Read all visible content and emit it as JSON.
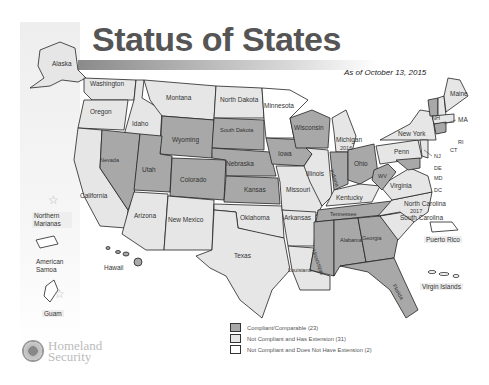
{
  "title": "Status of States",
  "as_of": "As of October 13, 2015",
  "colors": {
    "compliant": "#a8a8a8",
    "extension": "#e6e6e6",
    "no_extension": "#ffffff",
    "border": "#222222"
  },
  "legend": [
    {
      "label": "Compliant/Comparable (23)",
      "status": "compliant"
    },
    {
      "label": "Not Compliant and Has Extension (31)",
      "status": "extension"
    },
    {
      "label": "Not Compliant and Does Not Have Extension (2)",
      "status": "no_extension"
    }
  ],
  "states": {
    "alaska": "Alaska",
    "washington": "Washington",
    "oregon": "Oregon",
    "idaho": "Idaho",
    "montana": "Montana",
    "north_dakota": "North Dakota",
    "minnesota": "Minnesota",
    "wisconsin": "Wisconsin",
    "michigan": "Michigan",
    "michigan_year": "2016",
    "south_dakota": "South Dakota",
    "wyoming": "Wyoming",
    "nevada": "Nevada",
    "utah": "Utah",
    "colorado": "Colorado",
    "nebraska": "Nebraska",
    "iowa": "Iowa",
    "illinois": "Illinois",
    "indiana": "Indiana",
    "ohio": "Ohio",
    "california": "California",
    "arizona": "Arizona",
    "new_mexico": "New Mexico",
    "kansas": "Kansas",
    "missouri": "Missouri",
    "oklahoma": "Oklahoma",
    "arkansas": "Arkansas",
    "kentucky": "Kentucky",
    "tennessee": "Tennessee",
    "texas": "Texas",
    "louisiana": "Louisiana",
    "mississippi": "Mississippi",
    "alabama": "Alabama",
    "georgia": "Georgia",
    "florida": "Florida",
    "south_carolina": "South Carolina",
    "north_carolina": "North Carolina",
    "north_carolina_year": "2017",
    "virginia": "Virginia",
    "wv": "WV",
    "penn": "Penn",
    "new_york": "New York",
    "maine": "Maine",
    "nh": "NH",
    "vt": "VT",
    "ma": "MA",
    "ri": "RI",
    "ct": "CT",
    "nj": "NJ",
    "de": "DE",
    "md": "MD",
    "dc": "DC",
    "hawaii": "Hawaii"
  },
  "territories": {
    "northern_marianas": "Northern Marianas",
    "american_samoa": "American Samoa",
    "guam": "Guam",
    "puerto_rico": "Puerto Rico",
    "virgin_islands": "Virgin Islands"
  },
  "agency": {
    "line1": "Homeland",
    "line2": "Security"
  }
}
